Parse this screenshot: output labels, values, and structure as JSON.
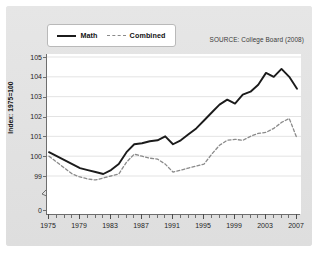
{
  "figure": {
    "source_note": "SOURCE: College Board (2008)",
    "y_axis_title": "Index: 1975=100"
  },
  "legend": {
    "entries": [
      {
        "label": "Math",
        "style": "solid",
        "color": "#1b1b1b"
      },
      {
        "label": "Combined",
        "style": "dashed",
        "color": "#8a8a8a"
      }
    ]
  },
  "axis": {
    "y_ticks": [
      "105",
      "104",
      "103",
      "102",
      "101",
      "100",
      "99",
      "0"
    ],
    "x_ticks": [
      "1975",
      "1979",
      "1983",
      "1987",
      "1991",
      "1995",
      "1999",
      "2003",
      "2007"
    ]
  },
  "chart_data": {
    "type": "line",
    "title": "",
    "subtitle": "",
    "xlabel": "",
    "ylabel": "Index: 1975=100",
    "xlim": [
      1975,
      2007
    ],
    "ylim": [
      98.6,
      105
    ],
    "grid": true,
    "grid_axis": "y",
    "legend_position": "top-left",
    "annotations": [
      "SOURCE: College Board (2008)"
    ],
    "y_axis_break": true,
    "y_axis_break_between": [
      0,
      98.6
    ],
    "x": [
      1975,
      1976,
      1977,
      1978,
      1979,
      1980,
      1981,
      1982,
      1983,
      1984,
      1985,
      1986,
      1987,
      1988,
      1989,
      1990,
      1991,
      1992,
      1993,
      1994,
      1995,
      1996,
      1997,
      1998,
      1999,
      2000,
      2001,
      2002,
      2003,
      2004,
      2005,
      2006,
      2007
    ],
    "series": [
      {
        "name": "Math",
        "style": "solid",
        "color": "#1b1b1b",
        "values": [
          100.2,
          100.0,
          99.8,
          99.6,
          99.4,
          99.3,
          99.2,
          99.1,
          99.3,
          99.6,
          100.2,
          100.6,
          100.65,
          100.75,
          100.8,
          101.0,
          100.6,
          100.8,
          101.1,
          101.4,
          101.8,
          102.2,
          102.6,
          102.85,
          102.65,
          103.1,
          103.25,
          103.6,
          104.2,
          104.0,
          104.4,
          104.0,
          103.4
        ]
      },
      {
        "name": "Combined",
        "style": "dashed",
        "color": "#8a8a8a",
        "values": [
          100.0,
          99.7,
          99.4,
          99.1,
          98.95,
          98.85,
          98.8,
          98.9,
          99.0,
          99.1,
          99.7,
          100.1,
          100.0,
          99.9,
          99.85,
          99.6,
          99.2,
          99.3,
          99.4,
          99.5,
          99.6,
          100.1,
          100.55,
          100.8,
          100.85,
          100.8,
          101.0,
          101.15,
          101.2,
          101.4,
          101.7,
          101.9,
          100.9
        ]
      }
    ]
  }
}
